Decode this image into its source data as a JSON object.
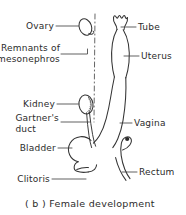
{
  "figure": {
    "caption": "( b ) Female development",
    "ink_color": "#333333",
    "text_color": "#2b2b2b",
    "background_color": "#ffffff"
  },
  "labels_left": [
    {
      "id": "ovary",
      "text": "Ovary"
    },
    {
      "id": "mesonephros",
      "text": "Remnants of"
    },
    {
      "id": "mesonephros2",
      "text": "mesonephros"
    },
    {
      "id": "kidney",
      "text": "Kidney"
    },
    {
      "id": "gartner",
      "text": "Gartner's"
    },
    {
      "id": "gartner2",
      "text": "duct"
    },
    {
      "id": "bladder",
      "text": "Bladder"
    },
    {
      "id": "clitoris",
      "text": "Clitoris"
    }
  ],
  "labels_right": [
    {
      "id": "tube",
      "text": "Tube"
    },
    {
      "id": "uterus",
      "text": "Uterus"
    },
    {
      "id": "vagina",
      "text": "Vagina"
    },
    {
      "id": "rectum",
      "text": "Rectum"
    }
  ],
  "structures": [
    {
      "id": "ovary",
      "name": "ovary"
    },
    {
      "id": "mesonephros",
      "name": "remnants-of-mesonephros"
    },
    {
      "id": "kidney",
      "name": "kidney"
    },
    {
      "id": "gartners-duct",
      "name": "gartners-duct"
    },
    {
      "id": "bladder",
      "name": "bladder"
    },
    {
      "id": "clitoris",
      "name": "clitoris"
    },
    {
      "id": "tube",
      "name": "uterine-tube"
    },
    {
      "id": "uterus",
      "name": "uterus"
    },
    {
      "id": "vagina",
      "name": "vagina"
    },
    {
      "id": "rectum",
      "name": "rectum"
    },
    {
      "id": "midline",
      "name": "midline-axis"
    }
  ]
}
